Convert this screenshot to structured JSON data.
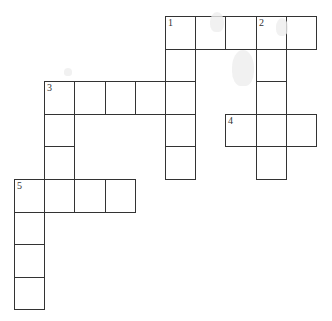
{
  "puzzle": {
    "type": "crossword",
    "grid_origin": {
      "x": 14,
      "y": 16
    },
    "cell_size": {
      "w": 30.2,
      "h": 32.6
    },
    "border_color": "#333333",
    "entries": [
      {
        "number": "1",
        "direction": "across",
        "row": 0,
        "col": 5,
        "length": 5
      },
      {
        "number": "1",
        "direction": "down",
        "row": 0,
        "col": 5,
        "length": 5
      },
      {
        "number": "2",
        "direction": "down",
        "row": 0,
        "col": 8,
        "length": 5
      },
      {
        "number": "3",
        "direction": "across",
        "row": 2,
        "col": 1,
        "length": 5
      },
      {
        "number": "3",
        "direction": "down",
        "row": 2,
        "col": 1,
        "length": 4
      },
      {
        "number": "4",
        "direction": "across",
        "row": 3,
        "col": 7,
        "length": 3
      },
      {
        "number": "5",
        "direction": "across",
        "row": 5,
        "col": 0,
        "length": 4
      },
      {
        "number": "5",
        "direction": "down",
        "row": 5,
        "col": 0,
        "length": 4
      }
    ],
    "labels": [
      {
        "number": "1",
        "row": 0,
        "col": 5
      },
      {
        "number": "2",
        "row": 0,
        "col": 8
      },
      {
        "number": "3",
        "row": 2,
        "col": 1
      },
      {
        "number": "4",
        "row": 3,
        "col": 7
      },
      {
        "number": "5",
        "row": 5,
        "col": 0
      }
    ]
  }
}
